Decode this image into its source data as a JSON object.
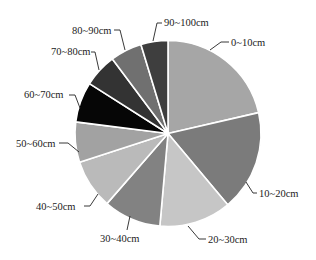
{
  "chart_data": {
    "type": "pie",
    "title": "",
    "start_angle_deg": 0,
    "direction": "clockwise",
    "categories": [
      "0~10cm",
      "10~20cm",
      "20~30cm",
      "30~40cm",
      "40~50cm",
      "50~60cm",
      "60~70cm",
      "70~80cm",
      "80~90cm",
      "90~100cm"
    ],
    "values": [
      21.4,
      17.5,
      12.5,
      10.0,
      8.6,
      7.0,
      7.0,
      5.8,
      5.5,
      4.7
    ],
    "unit": "%",
    "colors": [
      "#a6a6a6",
      "#7b7b7b",
      "#c6c6c6",
      "#828282",
      "#bababa",
      "#a2a2a2",
      "#060606",
      "#333333",
      "#707070",
      "#3e3e3e"
    ],
    "legend": "none (callout labels with leader lines)",
    "grid": false
  },
  "labels": [
    {
      "text": "0~10cm",
      "x": 231,
      "y": 46,
      "anchor": "start",
      "line": [
        [
          229,
          42
        ],
        [
          221,
          42
        ],
        [
          210,
          50
        ]
      ]
    },
    {
      "text": "10~20cm",
      "x": 259,
      "y": 197,
      "anchor": "start",
      "line": [
        [
          257,
          193
        ],
        [
          253,
          193
        ],
        [
          246,
          182
        ]
      ]
    },
    {
      "text": "20~30cm",
      "x": 208,
      "y": 243,
      "anchor": "start",
      "line": [
        [
          206,
          239
        ],
        [
          199,
          239
        ],
        [
          188,
          226
        ]
      ]
    },
    {
      "text": "30~40cm",
      "x": 100,
      "y": 242,
      "anchor": "start",
      "line": [
        [
          127,
          230
        ],
        [
          130,
          216
        ]
      ]
    },
    {
      "text": "40~50cm",
      "x": 36,
      "y": 210,
      "anchor": "start",
      "line": [
        [
          84,
          206
        ],
        [
          90,
          206
        ],
        [
          98,
          194
        ]
      ]
    },
    {
      "text": "50~60cm",
      "x": 16,
      "y": 147,
      "anchor": "start",
      "line": [
        [
          59,
          143
        ],
        [
          68,
          143
        ],
        [
          79,
          152
        ]
      ]
    },
    {
      "text": "60~70cm",
      "x": 24,
      "y": 98,
      "anchor": "start",
      "line": [
        [
          69,
          95
        ],
        [
          75,
          95
        ],
        [
          80,
          108
        ]
      ]
    },
    {
      "text": "70~80cm",
      "x": 51,
      "y": 55,
      "anchor": "start",
      "line": [
        [
          91,
          52
        ],
        [
          95,
          52
        ],
        [
          99,
          70
        ]
      ]
    },
    {
      "text": "80~90cm",
      "x": 72,
      "y": 34,
      "anchor": "start",
      "line": [
        [
          114,
          30
        ],
        [
          120,
          30
        ],
        [
          125,
          50
        ]
      ]
    },
    {
      "text": "90~100cm",
      "x": 164,
      "y": 26,
      "anchor": "start",
      "line": [
        [
          162,
          23
        ],
        [
          157,
          23
        ],
        [
          153,
          41
        ]
      ]
    }
  ]
}
